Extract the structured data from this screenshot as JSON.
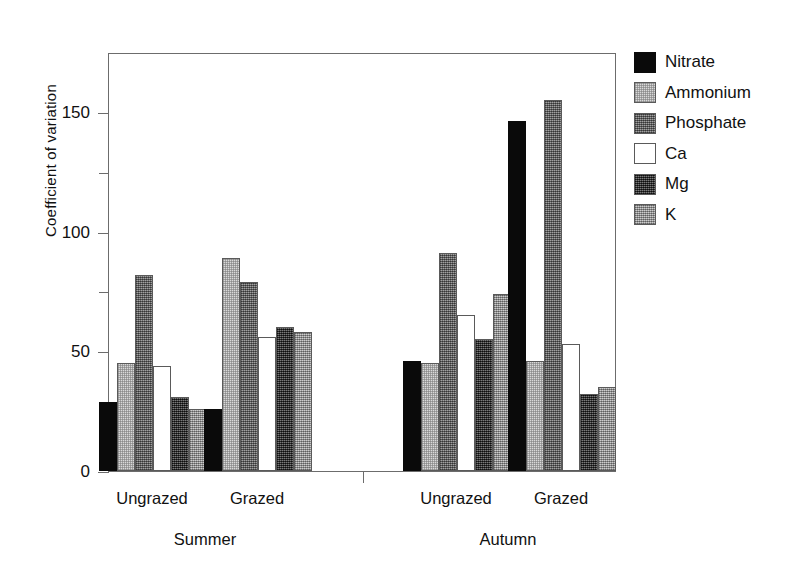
{
  "chart_data": {
    "type": "bar",
    "title": "",
    "xlabel": "",
    "ylabel": "Coefficient of variation",
    "ylim": [
      0,
      175
    ],
    "yticks": [
      0,
      50,
      100,
      150
    ],
    "ytick_labels": [
      "0",
      "50",
      "100",
      "150"
    ],
    "yminor_ticks": [
      25,
      75,
      125
    ],
    "grid": false,
    "legend_position": "right",
    "sections": [
      "Summer",
      "Autumn"
    ],
    "categories": [
      "Ungrazed",
      "Grazed",
      "Ungrazed",
      "Grazed"
    ],
    "group_sections": [
      "Summer",
      "Summer",
      "Autumn",
      "Autumn"
    ],
    "series": [
      {
        "name": "Nitrate",
        "color": "#0a0a0a",
        "values": [
          29,
          26,
          46,
          146
        ]
      },
      {
        "name": "Ammonium",
        "color": "#d9d9d9",
        "values": [
          45,
          89,
          45,
          46
        ]
      },
      {
        "name": "Phosphate",
        "color": "#6f6f6f",
        "values": [
          82,
          79,
          91,
          155
        ]
      },
      {
        "name": "Ca",
        "color": "#ffffff",
        "values": [
          44,
          56,
          65,
          53
        ]
      },
      {
        "name": "Mg",
        "color": "#434343",
        "values": [
          31,
          60,
          55,
          32
        ]
      },
      {
        "name": "K",
        "color": "#9d9d9d",
        "values": [
          26,
          58,
          74,
          35
        ]
      }
    ]
  },
  "legend": {
    "items": [
      {
        "label": "Nitrate",
        "swatch": "legend-swatch-nitrate"
      },
      {
        "label": "Ammonium",
        "swatch": "legend-swatch-ammonium"
      },
      {
        "label": "Phosphate",
        "swatch": "legend-swatch-phosphate"
      },
      {
        "label": "Ca",
        "swatch": "legend-swatch-ca"
      },
      {
        "label": "Mg",
        "swatch": "legend-swatch-mg"
      },
      {
        "label": "K",
        "swatch": "legend-swatch-k"
      }
    ]
  },
  "axes": {
    "y_title": "Coefficient of variation"
  }
}
